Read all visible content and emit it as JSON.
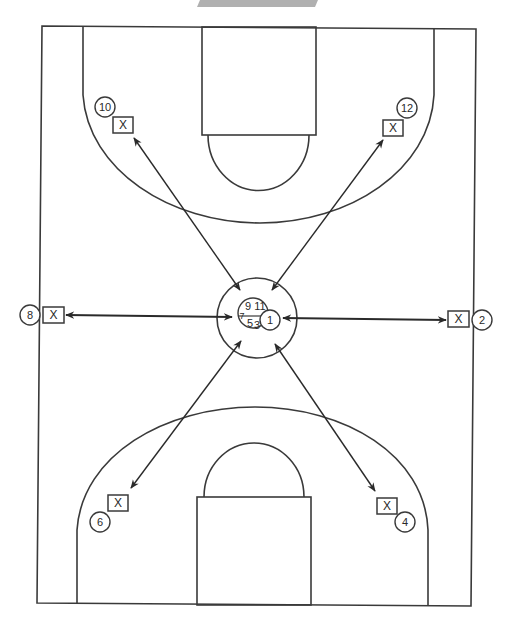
{
  "diagram": {
    "type": "basketball-drill",
    "colors": {
      "line": "#3a3a3a",
      "banner": "#b0b0b0",
      "background": "#ffffff"
    },
    "defender_marker": "X",
    "defenders": [
      {
        "id": "d-top-left",
        "label": "X",
        "x": 123,
        "y": 125
      },
      {
        "id": "d-top-right",
        "label": "X",
        "x": 393,
        "y": 128
      },
      {
        "id": "d-left",
        "label": "X",
        "x": 53,
        "y": 315
      },
      {
        "id": "d-right",
        "label": "X",
        "x": 458,
        "y": 319
      },
      {
        "id": "d-bottom-left",
        "label": "X",
        "x": 118,
        "y": 502
      },
      {
        "id": "d-bottom-right",
        "label": "X",
        "x": 387,
        "y": 505
      }
    ],
    "players": [
      {
        "number": "10",
        "x": 105,
        "y": 107
      },
      {
        "number": "12",
        "x": 407,
        "y": 108
      },
      {
        "number": "8",
        "x": 30,
        "y": 315
      },
      {
        "number": "2",
        "x": 482,
        "y": 320
      },
      {
        "number": "6",
        "x": 100,
        "y": 522
      },
      {
        "number": "4",
        "x": 405,
        "y": 522
      }
    ],
    "center_cluster": {
      "labels": [
        "9",
        "11",
        "7",
        "5",
        "3"
      ],
      "ball_handler": "1"
    },
    "passes": [
      {
        "from": "center",
        "to": "10"
      },
      {
        "from": "center",
        "to": "12"
      },
      {
        "from": "center",
        "to": "8"
      },
      {
        "from": "center",
        "to": "2"
      },
      {
        "from": "center",
        "to": "6"
      },
      {
        "from": "center",
        "to": "4"
      }
    ]
  }
}
